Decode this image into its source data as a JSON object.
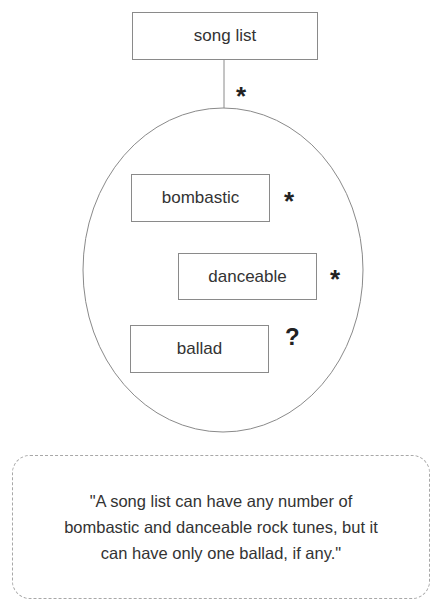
{
  "diagram": {
    "root": {
      "label": "song list"
    },
    "root_multiplicity": "*",
    "children": [
      {
        "label": "bombastic",
        "multiplicity": "*"
      },
      {
        "label": "danceable",
        "multiplicity": "*"
      },
      {
        "label": "ballad",
        "multiplicity": "?"
      }
    ]
  },
  "note": {
    "lines": [
      "\"A song list can have any number of",
      "bombastic and danceable rock tunes, but it",
      "can have only one ballad, if any.\""
    ]
  }
}
